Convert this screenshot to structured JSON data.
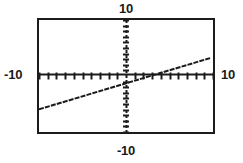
{
  "figure": {
    "kind": "graphing-calculator-plot",
    "background_color": "#ffffff",
    "frame_color": "#1c1c1c",
    "axis_color": "#1c1c1c",
    "curve_color": "#1a1a1a"
  },
  "labels": {
    "y_max": "10",
    "y_min": "-10",
    "x_min": "-10",
    "x_max": "10"
  },
  "chart_data": {
    "type": "line",
    "title": "",
    "xlabel": "",
    "ylabel": "",
    "xlim": [
      -10,
      10
    ],
    "ylim": [
      -10,
      10
    ],
    "xtick_labels": [
      "-10",
      "10"
    ],
    "ytick_labels": [
      "-10",
      "10"
    ],
    "x_tick_step": 1,
    "y_tick_step": 1,
    "grid": false,
    "legend": "none",
    "axes_style": "centered-crosshair-with-tick-marks",
    "series": [
      {
        "name": "y = 0.465x - 1.3",
        "slope": 0.465,
        "intercept": -1.3,
        "x": [
          -10,
          -5,
          0,
          5,
          9.7
        ],
        "values": [
          -5.95,
          -3.63,
          -1.3,
          1.03,
          3.21
        ]
      }
    ],
    "annotations": []
  }
}
